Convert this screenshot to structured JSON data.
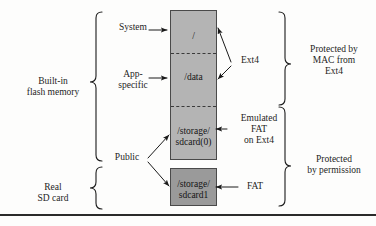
{
  "diagram": {
    "left_labels": [
      {
        "id": "builtin-flash",
        "text": "Built-in\nflash memory"
      },
      {
        "id": "real-sd-card",
        "text": "Real\nSD card"
      }
    ],
    "access_labels": [
      {
        "id": "system",
        "text": "System"
      },
      {
        "id": "app-specific",
        "text": "App-\nspecific"
      },
      {
        "id": "public",
        "text": "Public"
      }
    ],
    "partitions": {
      "internal": {
        "name": "internal-flash-box",
        "fill": "#b4b4b4",
        "segments": [
          {
            "id": "root",
            "text": "/"
          },
          {
            "id": "data",
            "text": "/data"
          },
          {
            "id": "sdcard0",
            "text": "/storage/\nsdcard(0)"
          }
        ]
      },
      "sdcard": {
        "name": "sd-card-box",
        "fill": "#9a9a9a",
        "segments": [
          {
            "id": "sdcard1",
            "text": "/storage/\nsdcard1"
          }
        ]
      }
    },
    "filesystem_labels": [
      {
        "id": "ext4",
        "text": "Ext4"
      },
      {
        "id": "emulated-fat",
        "text": "Emulated\nFAT\non Ext4"
      },
      {
        "id": "fat",
        "text": "FAT"
      }
    ],
    "protection_labels": [
      {
        "id": "mac-protection",
        "text": "Protected by\nMAC from\nExt4"
      },
      {
        "id": "permission-protection",
        "text": "Protected\nby permission"
      }
    ]
  }
}
